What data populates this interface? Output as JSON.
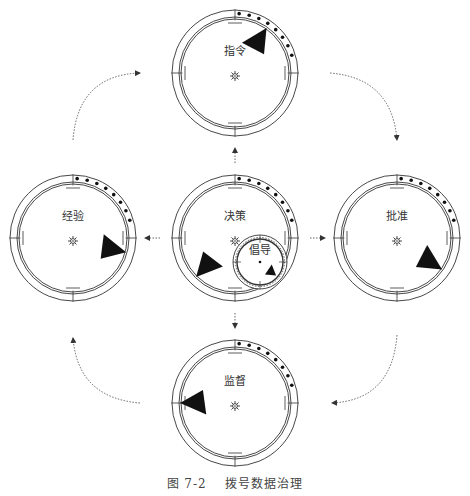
{
  "caption": {
    "figure_number": "图 7-2",
    "title": "拨号数据治理"
  },
  "colors": {
    "stroke": "#333333",
    "fill": "#111111",
    "arrow": "#555555",
    "background": "#ffffff"
  },
  "dials": [
    {
      "id": "instruction",
      "label": "指令",
      "cx": 235,
      "cy": 73,
      "r": 63,
      "pointer_angle": -55,
      "pointer_from": "rim",
      "has_star": true
    },
    {
      "id": "experience",
      "label": "经验",
      "cx": 73,
      "cy": 238,
      "r": 63,
      "pointer_angle": 15,
      "pointer_from": "rim",
      "has_star": true
    },
    {
      "id": "decision",
      "label": "决策",
      "cx": 235,
      "cy": 238,
      "r": 63,
      "pointer_angle": 135,
      "pointer_from": "rim",
      "has_star": true
    },
    {
      "id": "approval",
      "label": "批准",
      "cx": 397,
      "cy": 238,
      "r": 63,
      "pointer_angle": 35,
      "pointer_from": "rim",
      "has_star": true
    },
    {
      "id": "supervision",
      "label": "监督",
      "cx": 235,
      "cy": 403,
      "r": 63,
      "pointer_angle": 180,
      "pointer_from": "rim",
      "has_star": true
    }
  ],
  "sub_dial": {
    "id": "advocacy",
    "label": "倡导",
    "cx": 260,
    "cy": 262,
    "r": 23,
    "pointer_angle": 40
  },
  "arrows": {
    "center_links": [
      {
        "from": "decision",
        "to": "instruction",
        "direction": "up"
      },
      {
        "from": "decision",
        "to": "experience",
        "direction": "left"
      },
      {
        "from": "decision",
        "to": "approval",
        "direction": "right"
      },
      {
        "from": "decision",
        "to": "supervision",
        "direction": "down"
      }
    ],
    "cycle": [
      {
        "from": "experience",
        "to": "instruction"
      },
      {
        "from": "instruction",
        "to": "approval"
      },
      {
        "from": "approval",
        "to": "supervision"
      },
      {
        "from": "supervision",
        "to": "experience"
      }
    ]
  }
}
